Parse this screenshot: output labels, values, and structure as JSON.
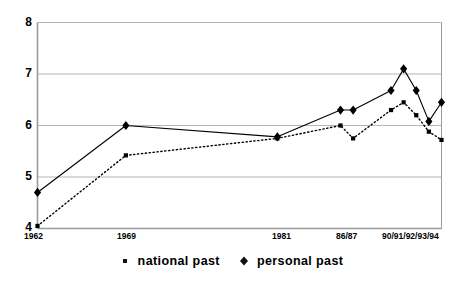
{
  "chart_data": {
    "type": "line",
    "title": "",
    "subtitle": "",
    "xlabel": "",
    "ylabel": "",
    "ylim": [
      4,
      8
    ],
    "yticks": [
      4,
      5,
      6,
      7,
      8
    ],
    "ytick_labels": [
      "4",
      "5",
      "6",
      "7",
      "8"
    ],
    "grid": true,
    "grid_axis": "y",
    "legend_position": "bottom-center",
    "x_tick_labels": [
      "1962",
      "1969",
      "1981",
      "86/87",
      "90/91/92/93/94"
    ],
    "x_tick_positions": [
      1962,
      1969,
      1981,
      1986.5,
      1992
    ],
    "x_range": [
      1962,
      1994
    ],
    "series": [
      {
        "name": "national past",
        "marker": "square",
        "linestyle": "dotted",
        "color": "#000000",
        "x": [
          1962,
          1969,
          1981,
          1986,
          1987,
          1990,
          1991,
          1992,
          1993,
          1994
        ],
        "values": [
          4.05,
          5.42,
          5.75,
          6.0,
          5.75,
          6.3,
          6.45,
          6.2,
          5.88,
          5.72
        ]
      },
      {
        "name": "personal past",
        "marker": "diamond",
        "linestyle": "solid",
        "color": "#000000",
        "x": [
          1962,
          1969,
          1981,
          1986,
          1987,
          1990,
          1991,
          1992,
          1993,
          1994
        ],
        "values": [
          4.7,
          6.0,
          5.78,
          6.3,
          6.3,
          6.68,
          7.1,
          6.68,
          6.08,
          6.45
        ]
      }
    ]
  },
  "axes": {
    "y_labels": [
      "8",
      "7",
      "6",
      "5",
      "4"
    ],
    "x_labels": [
      "1962",
      "1969",
      "1981",
      "86/87",
      "90/91/92/93/94"
    ]
  },
  "legend": {
    "entries": [
      {
        "label": "national past",
        "marker": "square-marker-icon"
      },
      {
        "label": "personal past",
        "marker": "diamond-marker-icon"
      }
    ]
  },
  "colors": {
    "axis": "#9a9a9a",
    "grid": "#b5b5b5",
    "series": "#111111",
    "background": "#ffffff"
  }
}
